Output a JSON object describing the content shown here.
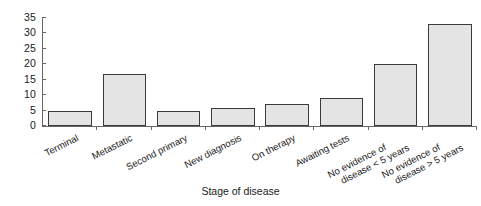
{
  "chart_data": {
    "type": "bar",
    "title": "",
    "xlabel": "Stage of disease",
    "ylabel": "",
    "ylim": [
      0,
      35
    ],
    "yticks": [
      0,
      5,
      10,
      15,
      20,
      25,
      30,
      35
    ],
    "grid": false,
    "legend": null,
    "categories": [
      "Terminal",
      "Metastatic",
      "Second primary",
      "New diagnosis",
      "On therapy",
      "Awaiting tests",
      "No evidence of disease < 5 years",
      "No evidence of disease > 5 years"
    ],
    "category_lines": [
      [
        "Terminal"
      ],
      [
        "Metastatic"
      ],
      [
        "Second primary"
      ],
      [
        "New diagnosis"
      ],
      [
        "On therapy"
      ],
      [
        "Awaiting tests"
      ],
      [
        "No evidence of",
        "disease < 5 years"
      ],
      [
        "No evidence of",
        "disease > 5 years"
      ]
    ],
    "values": [
      5,
      17,
      5,
      6,
      7,
      9,
      20,
      33
    ],
    "bar_fill": "#e4e4e4",
    "bar_stroke": "#3a3a3a",
    "axis_color": "#666666"
  }
}
